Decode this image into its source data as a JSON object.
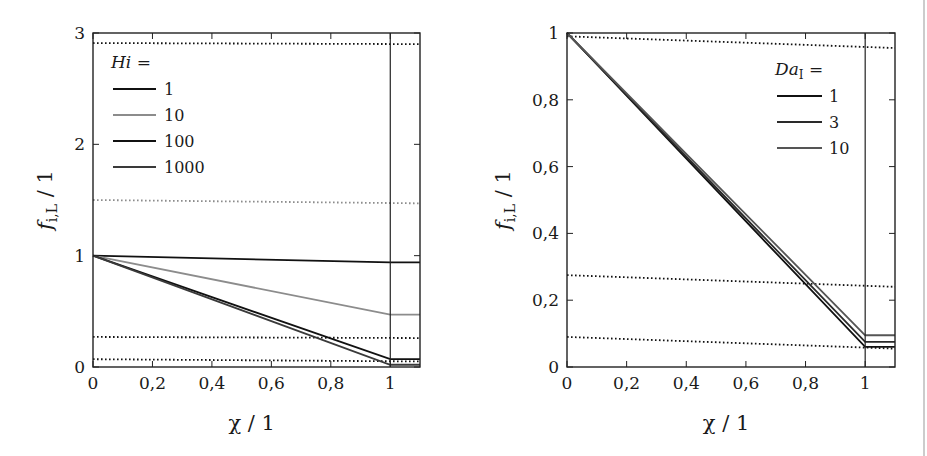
{
  "chart_data": [
    {
      "type": "line",
      "title": "",
      "xlabel": "χ / 1",
      "ylabel": "f_{i,L} / 1",
      "xlim": [
        0,
        1.1
      ],
      "ylim": [
        0,
        3
      ],
      "xticks": [
        "0",
        "0,2",
        "0,4",
        "0,6",
        "0,8",
        "1"
      ],
      "yticks": [
        "0",
        "1",
        "2",
        "3"
      ],
      "grid": false,
      "legend_title": "Hi =",
      "legend_position": "upper left",
      "series": [
        {
          "name": "1",
          "color": "#111111",
          "x": [
            0,
            1,
            1.1
          ],
          "y": [
            1.0,
            0.94,
            0.94
          ]
        },
        {
          "name": "10",
          "color": "#8c8c8c",
          "x": [
            0,
            1,
            1.1
          ],
          "y": [
            1.0,
            0.47,
            0.47
          ]
        },
        {
          "name": "100",
          "color": "#111111",
          "x": [
            0,
            1,
            1.1
          ],
          "y": [
            1.0,
            0.07,
            0.07
          ]
        },
        {
          "name": "1000",
          "color": "#3a3a3a",
          "x": [
            0,
            1,
            1.1
          ],
          "y": [
            1.0,
            0.02,
            0.02
          ]
        }
      ],
      "reference_lines": [
        {
          "style": "dotted",
          "color": "#111111",
          "x": [
            0,
            1.1
          ],
          "y": [
            2.91,
            2.9
          ]
        },
        {
          "style": "dotted",
          "color": "#8c8c8c",
          "x": [
            0,
            1.1
          ],
          "y": [
            1.5,
            1.47
          ]
        },
        {
          "style": "dotted",
          "color": "#111111",
          "x": [
            0,
            1.1
          ],
          "y": [
            0.27,
            0.26
          ]
        },
        {
          "style": "dotted",
          "color": "#111111",
          "x": [
            0,
            1.1
          ],
          "y": [
            0.07,
            0.05
          ]
        }
      ],
      "vline_x": 1
    },
    {
      "type": "line",
      "title": "",
      "xlabel": "χ / 1",
      "ylabel": "f_{i,L} / 1",
      "xlim": [
        0,
        1.1
      ],
      "ylim": [
        0,
        1
      ],
      "xticks": [
        "0",
        "0,2",
        "0,4",
        "0,6",
        "0,8",
        "1"
      ],
      "yticks": [
        "0",
        "0,2",
        "0,4",
        "0,6",
        "0,8",
        "1"
      ],
      "grid": false,
      "legend_title": "Da_I =",
      "legend_position": "upper right",
      "series": [
        {
          "name": "1",
          "color": "#111111",
          "x": [
            0,
            1,
            1.1
          ],
          "y": [
            1.0,
            0.06,
            0.06
          ]
        },
        {
          "name": "3",
          "color": "#2a2a2a",
          "x": [
            0,
            1,
            1.1
          ],
          "y": [
            1.0,
            0.075,
            0.075
          ]
        },
        {
          "name": "10",
          "color": "#555555",
          "x": [
            0,
            1,
            1.1
          ],
          "y": [
            1.0,
            0.095,
            0.095
          ]
        }
      ],
      "reference_lines": [
        {
          "style": "dotted",
          "color": "#111111",
          "x": [
            0,
            1.1
          ],
          "y": [
            0.99,
            0.955
          ]
        },
        {
          "style": "dotted",
          "color": "#111111",
          "x": [
            0,
            1.1
          ],
          "y": [
            0.275,
            0.24
          ]
        },
        {
          "style": "dotted",
          "color": "#111111",
          "x": [
            0,
            1.1
          ],
          "y": [
            0.09,
            0.055
          ]
        }
      ],
      "vline_x": 1
    }
  ],
  "plots": {
    "left": {
      "legend_title": "Hi =",
      "legend_items": [
        "1",
        "10",
        "100",
        "1000"
      ],
      "xlabel": "χ / 1",
      "ylabel": "f",
      "ylabel_sub": "i,L",
      "ylabel_tail": " / 1"
    },
    "right": {
      "legend_title": "Da",
      "legend_title_sub": "I",
      "legend_title_tail": " =",
      "legend_items": [
        "1",
        "3",
        "10"
      ],
      "xlabel": "χ / 1",
      "ylabel": "f",
      "ylabel_sub": "i,L",
      "ylabel_tail": " / 1"
    }
  }
}
